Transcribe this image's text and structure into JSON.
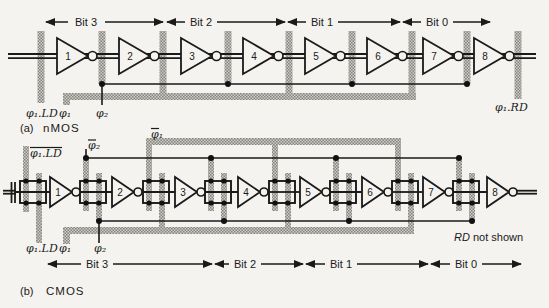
{
  "figure": {
    "background_color": "#f4f3ef",
    "ink_color": "#1a1a1a",
    "stipple_dark_color": "#86857f",
    "stipple_light_color": "#cdccc7",
    "nmos": {
      "caption_index": "(a)",
      "caption_name": "nMOS",
      "bits": [
        "Bit 3",
        "Bit 2",
        "Bit 1",
        "Bit 0"
      ],
      "inverters": [
        "1",
        "2",
        "3",
        "4",
        "5",
        "6",
        "7",
        "8"
      ],
      "clocks": {
        "ld": "φ₁.LD",
        "phi1": "φ₁",
        "phi2": "φ₂",
        "rd": "φ₁.RD"
      }
    },
    "cmos": {
      "caption_index": "(b)",
      "caption_name": "CMOS",
      "bits": [
        "Bit 3",
        "Bit 2",
        "Bit 1",
        "Bit 0"
      ],
      "inverters": [
        "1",
        "2",
        "3",
        "4",
        "5",
        "6",
        "7",
        "8"
      ],
      "clocks_top": {
        "ld": "φ₁.LD",
        "phi2": "φ₂",
        "phi1": "φ₁"
      },
      "clocks_bottom": {
        "ld": "φ₁.LD",
        "phi1": "φ₁",
        "phi2": "φ₂"
      },
      "rd_note": {
        "em": "RD",
        "rest": " not shown"
      }
    }
  }
}
